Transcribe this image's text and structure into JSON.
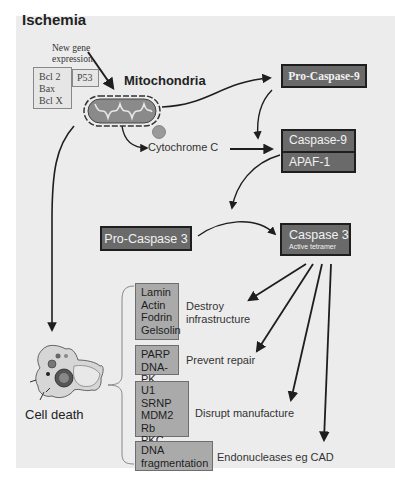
{
  "diagram": {
    "title": "Ischemia",
    "new_gene_expression": [
      "New gene",
      "expression"
    ],
    "bcl_box": [
      "Bcl 2",
      "Bax",
      "Bcl X"
    ],
    "p53_box": "P53",
    "mitochondria_label": "Mitochondria",
    "cytochrome_label": "Cytochrome C",
    "pro_caspase_9": "Pro-Caspase-9",
    "caspase_9": "Caspase-9",
    "apaf_1": "APAF-1",
    "pro_caspase_3": "Pro-Caspase 3",
    "caspase_3": "Caspase 3",
    "caspase_3_sub": "Active tetramer",
    "cell_death_label": "Cell death",
    "substrate_groups": [
      {
        "items": [
          "Lamin",
          "Actin",
          "Fodrin",
          "Gelsolin"
        ],
        "effect": [
          "Destroy",
          "infrastructure"
        ]
      },
      {
        "items": [
          "PARP",
          "DNA-PK"
        ],
        "effect": [
          "Prevent repair"
        ]
      },
      {
        "items": [
          "U1 SRNP",
          "MDM2",
          "Rb",
          "PKC"
        ],
        "effect": [
          "Disrupt manufacture"
        ]
      },
      {
        "items": [
          "DNA",
          "fragmentation"
        ],
        "effect": [
          "Endonucleases eg CAD"
        ]
      }
    ]
  },
  "colors": {
    "panel_bg": "#ececec",
    "dark_box": "#6a6a6a",
    "grey_box": "#aaaaaa",
    "arrow": "#1e1e1e"
  }
}
